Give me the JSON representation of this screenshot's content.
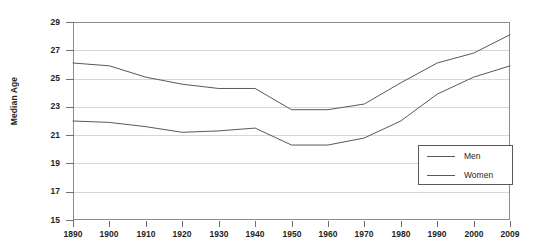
{
  "chart_data": {
    "type": "line",
    "title": "",
    "xlabel": "",
    "ylabel": "Median Age",
    "x": [
      1890,
      1900,
      1910,
      1920,
      1930,
      1940,
      1950,
      1960,
      1970,
      1980,
      1990,
      2000,
      2009
    ],
    "xtick_labels": [
      "1890",
      "1900",
      "1910",
      "1920",
      "1930",
      "1940",
      "1950",
      "1960",
      "1970",
      "1980",
      "1990",
      "2000",
      "2009"
    ],
    "ytick_labels": [
      "29",
      "27",
      "25",
      "23",
      "21",
      "19",
      "17",
      "15"
    ],
    "yticks": [
      29,
      27,
      25,
      23,
      21,
      19,
      17,
      15
    ],
    "ylim": [
      15,
      29
    ],
    "grid": true,
    "legend_position": "bottom-right",
    "series": [
      {
        "name": "Men",
        "color": "#58595b",
        "values": [
          26.1,
          25.9,
          25.1,
          24.6,
          24.3,
          24.3,
          22.8,
          22.8,
          23.2,
          24.7,
          26.1,
          26.8,
          28.1
        ]
      },
      {
        "name": "Women",
        "color": "#58595b",
        "values": [
          22.0,
          21.9,
          21.6,
          21.2,
          21.3,
          21.5,
          20.3,
          20.3,
          20.8,
          22.0,
          23.9,
          25.1,
          25.9
        ]
      }
    ]
  },
  "legend": {
    "items": [
      {
        "label": "Men"
      },
      {
        "label": "Women"
      }
    ]
  }
}
